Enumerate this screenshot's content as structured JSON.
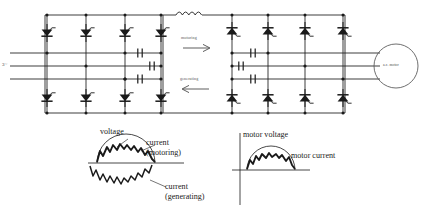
{
  "diagram": {
    "type": "circuit-schematic",
    "line_color": "#1a1a1a",
    "supply": {
      "label": "3~"
    },
    "link": {
      "inductor_name": "dc-link-inductor",
      "motoring_label": "motoring",
      "generating_label": "generating"
    },
    "bridges": [
      {
        "name": "source-side-converter",
        "columns": 4,
        "devices": "thyristor",
        "capacitors": 3
      },
      {
        "name": "load-side-inverter",
        "columns": 4,
        "devices": "thyristor",
        "capacitors": 3
      }
    ],
    "load": {
      "label": "a.c. motor"
    },
    "waveforms": [
      {
        "name": "supply-waveform",
        "labels": {
          "voltage": "voltage",
          "current_motoring_line1": "current",
          "current_motoring_line2": "(motoring)",
          "current_generating_line1": "current",
          "current_generating_line2": "(generating)"
        }
      },
      {
        "name": "motor-waveform",
        "labels": {
          "motor_voltage": "motor voltage",
          "motor_current": "motor current"
        }
      }
    ]
  }
}
